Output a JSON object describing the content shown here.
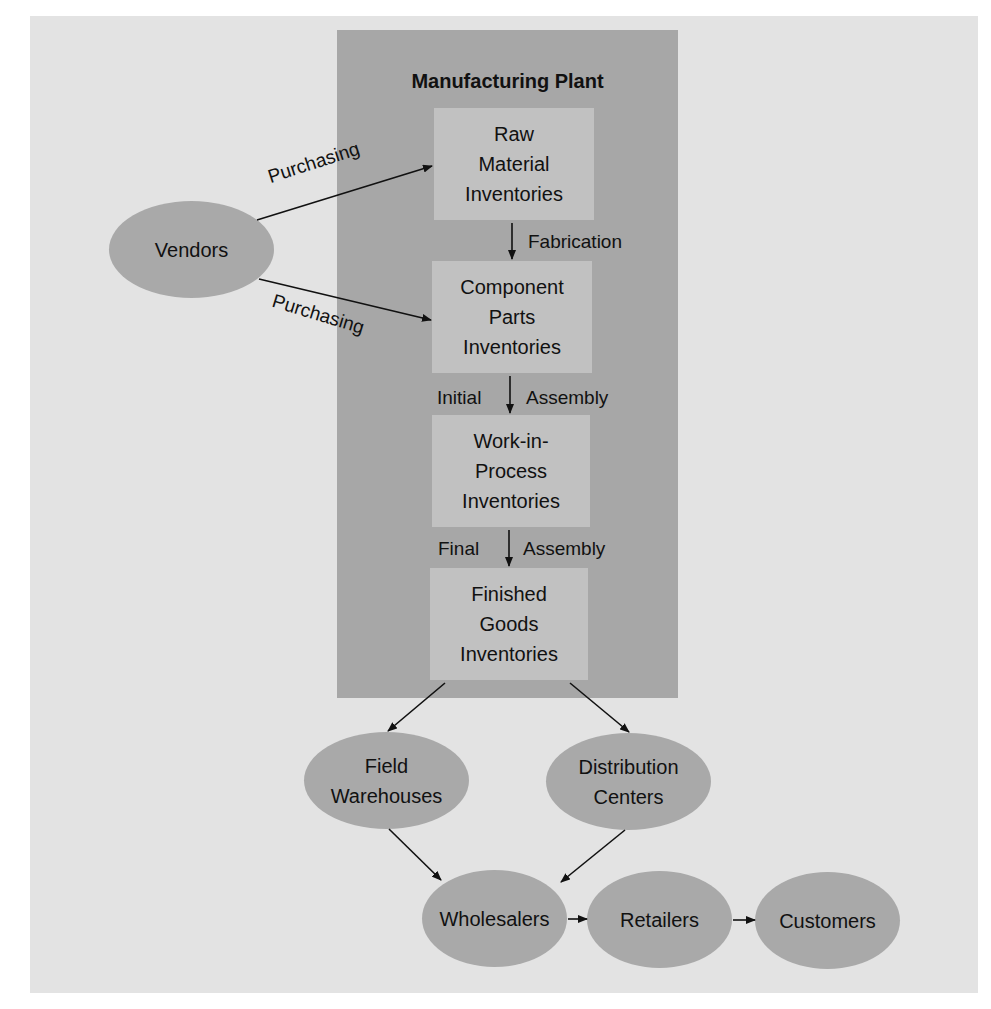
{
  "diagram": {
    "plant": {
      "title": "Manufacturing Plant"
    },
    "inventories": [
      {
        "id": "raw",
        "label": "Raw\nMaterial\nInventories"
      },
      {
        "id": "component",
        "label": "Component\nParts\nInventories"
      },
      {
        "id": "wip",
        "label": "Work-in-\nProcess\nInventories"
      },
      {
        "id": "finished",
        "label": "Finished\nGoods\nInventories"
      }
    ],
    "processes": {
      "fabrication": "Fabrication",
      "initial_left": "Initial",
      "initial_right": "Assembly",
      "final_left": "Final",
      "final_right": "Assembly",
      "purchasing_top": "Purchasing",
      "purchasing_bottom": "Purchasing"
    },
    "nodes": {
      "vendors": "Vendors",
      "field_warehouses": "Field\nWarehouses",
      "distribution_centers": "Distribution\nCenters",
      "wholesalers": "Wholesalers",
      "retailers": "Retailers",
      "customers": "Customers"
    },
    "edges": [
      {
        "from": "Vendors",
        "to": "Raw Material Inventories",
        "label": "Purchasing"
      },
      {
        "from": "Vendors",
        "to": "Component Parts Inventories",
        "label": "Purchasing"
      },
      {
        "from": "Raw Material Inventories",
        "to": "Component Parts Inventories",
        "label": "Fabrication"
      },
      {
        "from": "Component Parts Inventories",
        "to": "Work-in-Process Inventories",
        "label": "Initial Assembly"
      },
      {
        "from": "Work-in-Process Inventories",
        "to": "Finished Goods Inventories",
        "label": "Final Assembly"
      },
      {
        "from": "Finished Goods Inventories",
        "to": "Field Warehouses",
        "label": ""
      },
      {
        "from": "Finished Goods Inventories",
        "to": "Distribution Centers",
        "label": ""
      },
      {
        "from": "Field Warehouses",
        "to": "Wholesalers",
        "label": ""
      },
      {
        "from": "Distribution Centers",
        "to": "Wholesalers",
        "label": ""
      },
      {
        "from": "Wholesalers",
        "to": "Retailers",
        "label": ""
      },
      {
        "from": "Retailers",
        "to": "Customers",
        "label": ""
      }
    ],
    "colors": {
      "background": "#e3e3e3",
      "plant": "#a7a7a7",
      "box": "#c1c1c1",
      "ellipse": "#a9a9a9"
    }
  }
}
